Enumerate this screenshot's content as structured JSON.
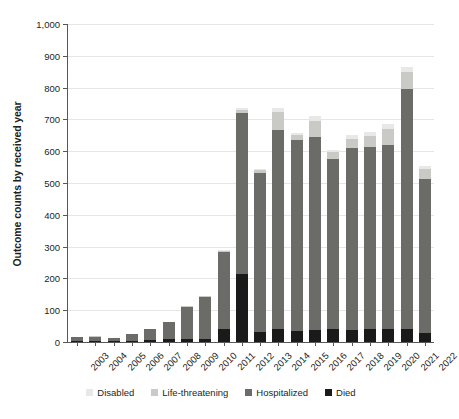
{
  "chart_data": {
    "type": "bar",
    "stacked": true,
    "title": "",
    "xlabel": "",
    "ylabel": "Outcome counts by received year",
    "ylim": [
      0,
      1000
    ],
    "ytick_values": [
      0,
      100,
      200,
      300,
      400,
      500,
      600,
      700,
      800,
      900,
      1000
    ],
    "ytick_labels": [
      "0",
      "100",
      "200",
      "300",
      "400",
      "500",
      "600",
      "700",
      "800",
      "900",
      "1,000"
    ],
    "grid": "horizontal",
    "legend_position": "bottom",
    "categories": [
      "2003",
      "2004",
      "2005",
      "2006",
      "2007",
      "2008",
      "2009",
      "2010",
      "2011",
      "2012",
      "2013",
      "2014",
      "2015",
      "2016",
      "2017",
      "2018",
      "2019",
      "2020",
      "2021",
      "2022"
    ],
    "series": [
      {
        "name": "Died",
        "color": "#1a1a1a",
        "values": [
          2,
          2,
          1,
          3,
          5,
          9,
          11,
          10,
          41,
          215,
          33,
          40,
          36,
          38,
          40,
          38,
          40,
          42,
          40,
          28
        ]
      },
      {
        "name": "Hospitalized",
        "color": "#6b6b68",
        "values": [
          13,
          15,
          10,
          21,
          35,
          53,
          100,
          131,
          241,
          505,
          499,
          628,
          600,
          608,
          537,
          572,
          573,
          577,
          755,
          485
        ]
      },
      {
        "name": "Life-threatening",
        "color": "#c9c9c6",
        "values": [
          1,
          1,
          1,
          1,
          2,
          2,
          3,
          3,
          5,
          10,
          9,
          55,
          15,
          50,
          20,
          30,
          35,
          50,
          55,
          30
        ]
      },
      {
        "name": "Disabled",
        "color": "#e8e8e6",
        "values": [
          0,
          0,
          0,
          0,
          0,
          0,
          0,
          1,
          2,
          5,
          4,
          12,
          5,
          14,
          6,
          10,
          12,
          16,
          15,
          10
        ]
      }
    ],
    "totals": [
      16,
      18,
      12,
      25,
      42,
      64,
      114,
      145,
      289,
      735,
      545,
      735,
      656,
      710,
      603,
      650,
      660,
      685,
      865,
      553
    ]
  },
  "legend": {
    "items": [
      {
        "label": "Disabled",
        "color": "#e8e8e6"
      },
      {
        "label": "Life-threatening",
        "color": "#c9c9c6"
      },
      {
        "label": "Hospitalized",
        "color": "#6b6b68"
      },
      {
        "label": "Died",
        "color": "#1a1a1a"
      }
    ]
  }
}
